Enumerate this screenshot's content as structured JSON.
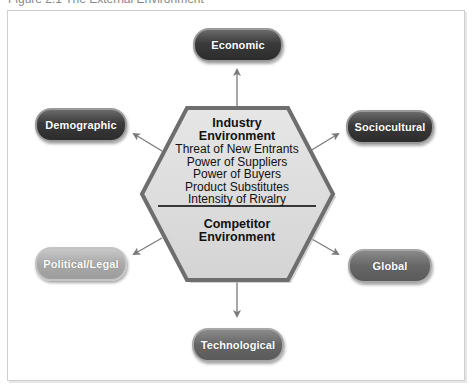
{
  "caption": "Figure 2.1 The External Environment",
  "center": {
    "industry": {
      "title_line1": "Industry",
      "title_line2": "Environment",
      "items": [
        "Threat of New Entrants",
        "Power of Suppliers",
        "Power of Buyers",
        "Product Substitutes",
        "Intensity of Rivalry"
      ]
    },
    "competitor": {
      "title_line1": "Competitor",
      "title_line2": "Environment"
    }
  },
  "segments": [
    {
      "label": "Economic",
      "position": "top"
    },
    {
      "label": "Demographic",
      "position": "upper-left"
    },
    {
      "label": "Sociocultural",
      "position": "upper-right"
    },
    {
      "label": "Political/Legal",
      "position": "lower-left"
    },
    {
      "label": "Global",
      "position": "lower-right"
    },
    {
      "label": "Technological",
      "position": "bottom"
    }
  ],
  "colors": {
    "hexagon_fill": "#dcdcdc",
    "hexagon_border": "#6e6e6e",
    "arrow": "#7a7a7a",
    "divider": "#000000"
  }
}
